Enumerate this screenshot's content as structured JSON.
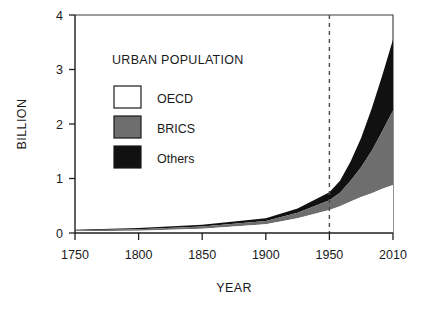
{
  "chart_data": {
    "type": "area",
    "title": "",
    "legend_title": "URBAN POPULATION",
    "xlabel": "YEAR",
    "ylabel": "BILLION",
    "stacked": true,
    "grid": false,
    "legend_position": "upper-left-inside",
    "xlim": [
      1750,
      2010
    ],
    "ylim": [
      0,
      4
    ],
    "xticks": [
      1750,
      1800,
      1850,
      1900,
      1950,
      2010
    ],
    "xtick_labels": [
      "1750",
      "1800",
      "1850",
      "1900",
      "1950",
      "2010"
    ],
    "yticks": [
      0,
      1,
      2,
      3,
      4
    ],
    "ytick_labels": [
      "0",
      "1",
      "2",
      "3",
      "4"
    ],
    "annotations": [
      {
        "name": "reference-line-1950",
        "type": "vertical-dashed-line",
        "x": 1950,
        "label": ""
      }
    ],
    "x": [
      1750,
      1800,
      1850,
      1900,
      1925,
      1950,
      1960,
      1970,
      1980,
      1990,
      2000,
      2010
    ],
    "series": [
      {
        "name": "OECD",
        "color": "#ffffff",
        "values": [
          0.03,
          0.04,
          0.08,
          0.16,
          0.27,
          0.42,
          0.49,
          0.58,
          0.66,
          0.73,
          0.81,
          0.88
        ]
      },
      {
        "name": "BRICS",
        "color": "#6e6e6e",
        "values": [
          0.02,
          0.03,
          0.04,
          0.06,
          0.1,
          0.18,
          0.25,
          0.38,
          0.55,
          0.78,
          1.06,
          1.37
        ]
      },
      {
        "name": "Others",
        "color": "#111111",
        "values": [
          0.01,
          0.02,
          0.03,
          0.05,
          0.08,
          0.15,
          0.22,
          0.35,
          0.54,
          0.78,
          1.03,
          1.3
        ]
      }
    ],
    "totals": [
      0.06,
      0.09,
      0.15,
      0.27,
      0.45,
      0.75,
      0.96,
      1.31,
      1.75,
      2.29,
      2.9,
      3.55
    ]
  },
  "legend": {
    "title": "URBAN POPULATION",
    "entries": [
      {
        "label": "OECD",
        "swatch": "white-swatch",
        "color": "#ffffff"
      },
      {
        "label": "BRICS",
        "swatch": "gray-swatch",
        "color": "#6e6e6e"
      },
      {
        "label": "Others",
        "swatch": "black-swatch",
        "color": "#111111"
      }
    ]
  },
  "axes": {
    "y_title": "BILLION",
    "x_title": "YEAR",
    "y_labels": [
      "4",
      "3",
      "2",
      "1",
      "0"
    ],
    "x_labels": [
      "1750",
      "1800",
      "1850",
      "1900",
      "1950",
      "2010"
    ]
  },
  "colors": {
    "oecd": "#ffffff",
    "brics": "#6e6e6e",
    "others": "#111111",
    "axis": "#1f1f1f",
    "reference_line": "#4a4a4a",
    "background": "#ffffff"
  }
}
